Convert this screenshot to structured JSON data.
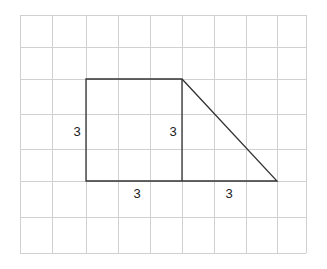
{
  "diagram": {
    "grid": {
      "columns": 9,
      "rows": 7,
      "x_lines": [
        20,
        52,
        86,
        118,
        150,
        182,
        214,
        246,
        277,
        306
      ],
      "y_lines": [
        15,
        47,
        79,
        114,
        149,
        181,
        217,
        253
      ],
      "line_color": "#d0d0d0"
    },
    "shape": {
      "stroke_color": "#333333",
      "square": {
        "x1": 86,
        "y1": 79,
        "x2": 182,
        "y2": 181
      },
      "triangle_hypotenuse": {
        "x1": 182,
        "y1": 79,
        "x2": 277,
        "y2": 181
      }
    },
    "labels": [
      {
        "text": "3",
        "x": 77,
        "y": 131,
        "refers_to": "square left side"
      },
      {
        "text": "3",
        "x": 173,
        "y": 131,
        "refers_to": "square right side / triangle height"
      },
      {
        "text": "3",
        "x": 137,
        "y": 193,
        "refers_to": "square bottom"
      },
      {
        "text": "3",
        "x": 229,
        "y": 193,
        "refers_to": "triangle base"
      }
    ]
  }
}
